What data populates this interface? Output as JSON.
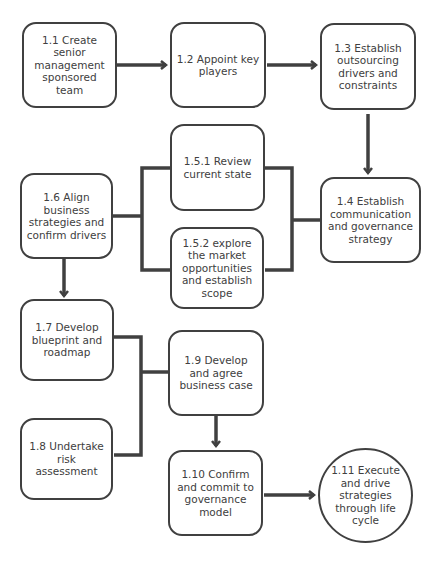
{
  "diagram": {
    "colors": {
      "stroke": "#404040",
      "text": "#404040",
      "background": "#ffffff"
    },
    "nodes": [
      {
        "id": "1.1",
        "label": "1.1 Create senior management sponsored team",
        "shape": "rounded-rect"
      },
      {
        "id": "1.2",
        "label": "1.2 Appoint key players",
        "shape": "rounded-rect"
      },
      {
        "id": "1.3",
        "label": "1.3 Establish outsourcing drivers and constraints",
        "shape": "rounded-rect"
      },
      {
        "id": "1.4",
        "label": "1.4 Establish communication and governance strategy",
        "shape": "rounded-rect"
      },
      {
        "id": "1.5.1",
        "label": "1.5.1 Review current state",
        "shape": "rounded-rect"
      },
      {
        "id": "1.5.2",
        "label": "1.5.2 explore the market opportunities and establish scope",
        "shape": "rounded-rect"
      },
      {
        "id": "1.6",
        "label": "1.6 Align business strategies and confirm drivers",
        "shape": "rounded-rect"
      },
      {
        "id": "1.7",
        "label": "1.7 Develop blueprint and roadmap",
        "shape": "rounded-rect"
      },
      {
        "id": "1.8",
        "label": "1.8 Undertake risk assessment",
        "shape": "rounded-rect"
      },
      {
        "id": "1.9",
        "label": "1.9 Develop and agree business case",
        "shape": "rounded-rect"
      },
      {
        "id": "1.10",
        "label": "1.10 Confirm and commit to governance model",
        "shape": "rounded-rect"
      },
      {
        "id": "1.11",
        "label": "1.11 Execute and drive strategies through life cycle",
        "shape": "circle"
      }
    ],
    "edges": [
      {
        "from": "1.1",
        "to": "1.2",
        "type": "arrow"
      },
      {
        "from": "1.2",
        "to": "1.3",
        "type": "arrow"
      },
      {
        "from": "1.3",
        "to": "1.4",
        "type": "arrow"
      },
      {
        "from": "1.4",
        "to": [
          "1.5.1",
          "1.5.2"
        ],
        "type": "bracket"
      },
      {
        "from": [
          "1.5.1",
          "1.5.2"
        ],
        "to": "1.6",
        "type": "bracket"
      },
      {
        "from": "1.6",
        "to": "1.7",
        "type": "arrow"
      },
      {
        "from": [
          "1.7",
          "1.8"
        ],
        "to": "1.9",
        "type": "bracket"
      },
      {
        "from": "1.9",
        "to": "1.10",
        "type": "arrow"
      },
      {
        "from": "1.10",
        "to": "1.11",
        "type": "arrow"
      }
    ]
  }
}
